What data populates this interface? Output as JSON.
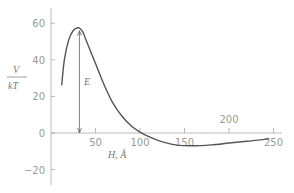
{
  "chart_data": {
    "type": "line",
    "title": "",
    "xlabel": "H, Å",
    "ylabel_num": "V",
    "ylabel_den": "kT",
    "annotation": "E",
    "xlim": [
      0,
      260
    ],
    "ylim": [
      -28,
      68
    ],
    "grid": false,
    "x_ticks": [
      50,
      100,
      150,
      200,
      250
    ],
    "x_tick_labels": [
      "50",
      "100",
      "150",
      "200",
      "250"
    ],
    "y_ticks": [
      60,
      40,
      20,
      0,
      -20
    ],
    "y_tick_labels": [
      "60",
      "40",
      "20",
      "0",
      "−20"
    ],
    "series": [
      {
        "name": "V/kT",
        "x": [
          12,
          15,
          20,
          25,
          30,
          33,
          36,
          40,
          50,
          60,
          70,
          80,
          90,
          100,
          110,
          120,
          140,
          160,
          180,
          200,
          220,
          240,
          245
        ],
        "values": [
          26,
          40,
          51,
          56,
          57.5,
          57,
          55,
          50,
          38,
          26,
          16,
          9,
          4,
          0.5,
          -2,
          -4,
          -6.5,
          -7,
          -6.5,
          -5.5,
          -4.5,
          -3.5,
          -3
        ]
      }
    ],
    "energy_barrier_arrow": {
      "x": 32,
      "from": 0,
      "to": 57
    }
  }
}
